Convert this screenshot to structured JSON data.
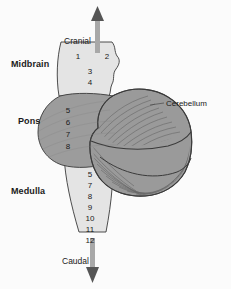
{
  "figure": {
    "background_color": "#fbfbfb"
  },
  "orientation": {
    "cranial_label": "Cranial",
    "caudal_label": "Caudal",
    "arrow_color": "#8c8c8c",
    "arrow_head_color": "#5a5a5a"
  },
  "regions": [
    {
      "id": "midbrain",
      "label": "Midbrain",
      "fill": "#e4e4e4",
      "nerve_numbers": [
        "1",
        "2",
        "3",
        "4"
      ]
    },
    {
      "id": "pons",
      "label": "Pons",
      "fill": "#9c9c9c",
      "nerve_numbers": [
        "5",
        "6",
        "7",
        "8"
      ]
    },
    {
      "id": "medulla",
      "label": "Medulla",
      "fill": "#e4e4e4",
      "nerve_numbers": [
        "5",
        "7",
        "8",
        "9",
        "10",
        "11",
        "12"
      ]
    }
  ],
  "cerebellum": {
    "label": "Cerebellum",
    "fill": "#9a9a9a",
    "outline": "#4a4a4a"
  },
  "nerve_numbers": {
    "midbrain_upper_left": "1",
    "midbrain_upper_right": "2",
    "midbrain_lower": [
      "3",
      "4"
    ],
    "pons_column": [
      "5",
      "6",
      "7",
      "8"
    ],
    "medulla_column": [
      "5",
      "7",
      "8",
      "9",
      "10",
      "11",
      "12"
    ]
  },
  "colors": {
    "outline": "#3a3a3a",
    "text": "#1a1a1a",
    "light_gray": "#e4e4e4",
    "mid_gray": "#9c9c9c"
  }
}
